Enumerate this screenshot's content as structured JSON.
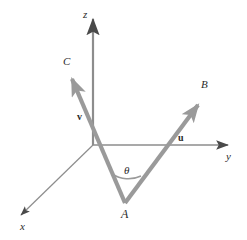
{
  "figure": {
    "type": "vector-diagram",
    "background_color": "#ffffff",
    "axis_color": "#6f6f6f",
    "vector_color": "#9a9a9a",
    "label_color": "#2b2b2b",
    "axes": [
      {
        "id": "z",
        "label": "z",
        "label_x": 83,
        "label_y": 9,
        "from_x": 93,
        "from_y": 145,
        "to_x": 93,
        "to_y": 17
      },
      {
        "id": "y",
        "label": "y",
        "label_x": 226,
        "label_y": 151,
        "from_x": 93,
        "from_y": 145,
        "to_x": 230,
        "to_y": 145
      },
      {
        "id": "x",
        "label": "x",
        "label_x": 20,
        "label_y": 221,
        "from_x": 93,
        "from_y": 145,
        "to_x": 19,
        "to_y": 217
      }
    ],
    "vectors": [
      {
        "id": "u",
        "label": "u",
        "label_x": 178,
        "label_y": 133,
        "tip_label": "B",
        "tip_label_x": 201,
        "tip_label_y": 79,
        "from_x": 125,
        "from_y": 203,
        "to_x": 201,
        "to_y": 101
      },
      {
        "id": "v",
        "label": "v",
        "label_x": 77,
        "label_y": 112,
        "tip_label": "C",
        "tip_label_x": 63,
        "tip_label_y": 56,
        "from_x": 125,
        "from_y": 203,
        "to_x": 70,
        "to_y": 74
      }
    ],
    "points": [
      {
        "id": "A",
        "label": "A",
        "label_x": 121,
        "label_y": 208,
        "x": 125,
        "y": 203
      }
    ],
    "angle": {
      "symbol": "θ",
      "label_x": 124,
      "label_y": 165,
      "vertex_x": 125,
      "vertex_y": 203,
      "radius": 30
    }
  }
}
